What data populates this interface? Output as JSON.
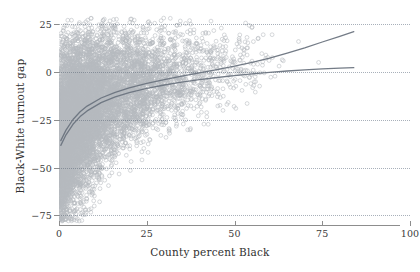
{
  "chart_data": {
    "type": "scatter",
    "title": "",
    "xlabel": "County percent Black",
    "ylabel": "Black-White turnout gap",
    "xlim": [
      0,
      100
    ],
    "ylim": [
      -80,
      30
    ],
    "grid": true,
    "grid_style": "dotted-horizontal",
    "legend": "none",
    "xticks": [
      0,
      25,
      50,
      75,
      100
    ],
    "xtick_labels": [
      "0",
      "25",
      "50",
      "75",
      "100"
    ],
    "yticks": [
      25,
      0,
      -25,
      -50,
      -75
    ],
    "ytick_labels": [
      "25",
      "0",
      "−25",
      "−50",
      "−75"
    ],
    "marker": {
      "shape": "open-circle",
      "radius": 1.9,
      "stroke": "#5d6672",
      "stroke_width": 0.55,
      "fill": "none",
      "opacity": 0.45
    },
    "point_count": 9000,
    "density_note": "Heaviest concentration at County percent Black 0-10 spanning turnout gap -75 to +5; spread narrows and shifts upward as percent Black increases.",
    "series": [
      {
        "name": "counties",
        "description": "One point per county-election observation",
        "x_range": [
          0,
          87
        ],
        "y_range": [
          -78,
          28
        ]
      }
    ],
    "trend_lines": [
      {
        "name": "upper-trend",
        "color": "#6b7480",
        "width": 1.3,
        "points": [
          [
            0.5,
            -36.0
          ],
          [
            2,
            -30.5
          ],
          [
            4,
            -25.0
          ],
          [
            6,
            -21.0
          ],
          [
            8,
            -18.0
          ],
          [
            12,
            -13.8
          ],
          [
            16,
            -10.8
          ],
          [
            20,
            -8.5
          ],
          [
            25,
            -6.2
          ],
          [
            30,
            -4.2
          ],
          [
            35,
            -2.4
          ],
          [
            40,
            -0.7
          ],
          [
            45,
            1.0
          ],
          [
            50,
            2.8
          ],
          [
            55,
            4.8
          ],
          [
            60,
            7.0
          ],
          [
            65,
            9.6
          ],
          [
            70,
            12.4
          ],
          [
            75,
            15.4
          ],
          [
            80,
            18.4
          ],
          [
            84,
            20.8
          ]
        ]
      },
      {
        "name": "lower-trend",
        "color": "#6b7480",
        "width": 1.3,
        "points": [
          [
            0.5,
            -38.5
          ],
          [
            2,
            -33.0
          ],
          [
            4,
            -27.5
          ],
          [
            6,
            -23.5
          ],
          [
            8,
            -20.5
          ],
          [
            12,
            -16.2
          ],
          [
            16,
            -13.2
          ],
          [
            20,
            -11.0
          ],
          [
            25,
            -8.8
          ],
          [
            30,
            -7.0
          ],
          [
            35,
            -5.5
          ],
          [
            40,
            -4.2
          ],
          [
            45,
            -3.1
          ],
          [
            50,
            -2.1
          ],
          [
            55,
            -1.2
          ],
          [
            60,
            -0.4
          ],
          [
            65,
            0.3
          ],
          [
            70,
            0.9
          ],
          [
            75,
            1.4
          ],
          [
            80,
            1.8
          ],
          [
            84,
            2.0
          ]
        ]
      }
    ]
  },
  "figure": {
    "background": "#ffffff",
    "axis_color": "#8d8d8d",
    "grid_color": "#9aa3ae",
    "text_color": "#2f2f2f"
  }
}
